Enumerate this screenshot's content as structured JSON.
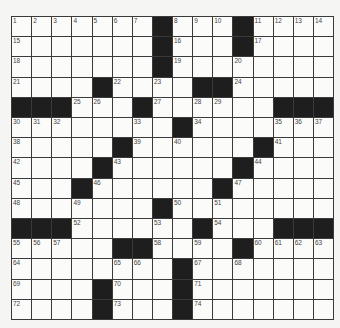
{
  "puzzle": {
    "columns": 16,
    "rows_count": 15,
    "black_color": "#1e1e1e",
    "grid": [
      [
        "1",
        "2",
        "3",
        "4",
        "5",
        "6",
        "7",
        "#",
        "8",
        "9",
        "10",
        "#",
        "11",
        "12",
        "13",
        "14"
      ],
      [
        "15",
        "",
        "",
        "",
        "",
        "",
        "",
        "#",
        "16",
        "",
        "",
        "#",
        "17",
        "",
        "",
        ""
      ],
      [
        "18",
        "",
        "",
        "",
        "",
        "",
        "",
        "#",
        "19",
        "",
        "",
        "20",
        "",
        "",
        "",
        ""
      ],
      [
        "21",
        "",
        "",
        "",
        "#",
        "22",
        "",
        "23",
        "",
        "#",
        "#",
        "24",
        "",
        "",
        "",
        ""
      ],
      [
        "#",
        "#",
        "#",
        "25",
        "26",
        "",
        "#",
        "27",
        "",
        "28",
        "29",
        "",
        "",
        "#",
        "#",
        "#"
      ],
      [
        "30",
        "31",
        "32",
        "",
        "",
        "",
        "33",
        "",
        "#",
        "34",
        "",
        "",
        "",
        "35",
        "36",
        "37"
      ],
      [
        "38",
        "",
        "",
        "",
        "",
        "#",
        "39",
        "",
        "40",
        "",
        "",
        "",
        "#",
        "41",
        "",
        ""
      ],
      [
        "42",
        "",
        "",
        "",
        "#",
        "43",
        "",
        "",
        "",
        "",
        "",
        "#",
        "44",
        "",
        "",
        ""
      ],
      [
        "45",
        "",
        "",
        "#",
        "46",
        "",
        "",
        "",
        "",
        "",
        "#",
        "47",
        "",
        "",
        "",
        ""
      ],
      [
        "48",
        "",
        "",
        "49",
        "",
        "",
        "",
        "#",
        "50",
        "",
        "51",
        "",
        "",
        "",
        "",
        ""
      ],
      [
        "#",
        "#",
        "#",
        "52",
        "",
        "",
        "",
        "53",
        "",
        "#",
        "54",
        "",
        "",
        "#",
        "#",
        "#"
      ],
      [
        "55",
        "56",
        "57",
        "",
        "",
        "#",
        "#",
        "58",
        "",
        "59",
        "",
        "#",
        "60",
        "61",
        "62",
        "63"
      ],
      [
        "64",
        "",
        "",
        "",
        "",
        "65",
        "66",
        "",
        "#",
        "67",
        "",
        "68",
        "",
        "",
        "",
        ""
      ],
      [
        "69",
        "",
        "",
        "",
        "#",
        "70",
        "",
        "",
        "#",
        "71",
        "",
        "",
        "",
        "",
        "",
        ""
      ],
      [
        "72",
        "",
        "",
        "",
        "#",
        "73",
        "",
        "",
        "#",
        "74",
        "",
        "",
        "",
        "",
        "",
        ""
      ]
    ]
  }
}
